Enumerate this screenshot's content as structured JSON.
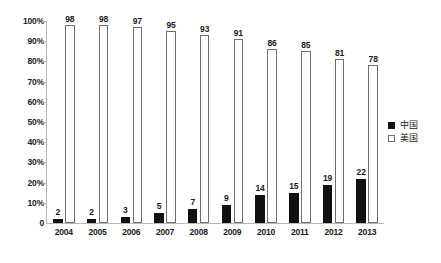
{
  "chart_data": {
    "type": "bar",
    "title": "",
    "subtitle": "",
    "xlabel": "",
    "ylabel": "",
    "categories": [
      "2004",
      "2005",
      "2006",
      "2007",
      "2008",
      "2009",
      "2010",
      "2011",
      "2012",
      "2013"
    ],
    "series": [
      {
        "name": "中国",
        "values": [
          2,
          2,
          3,
          5,
          7,
          9,
          14,
          15,
          19,
          22
        ],
        "color": "#111111",
        "style": "filled"
      },
      {
        "name": "美国",
        "values": [
          98,
          98,
          97,
          95,
          93,
          91,
          86,
          85,
          81,
          78
        ],
        "color": "#ffffff",
        "style": "outlined"
      }
    ],
    "ylim": [
      0,
      100
    ],
    "ytick_labels": [
      "100%",
      "90%",
      "80%",
      "70%",
      "60%",
      "50%",
      "40%",
      "30%",
      "20%",
      "10%",
      "0"
    ],
    "ytick_values": [
      100,
      90,
      80,
      70,
      60,
      50,
      40,
      30,
      20,
      10,
      0
    ],
    "grid": false,
    "data_labels": true,
    "legend_position": "right"
  },
  "legend": {
    "items": [
      {
        "label": "中国",
        "swatch": "filled-square-icon"
      },
      {
        "label": "美国",
        "swatch": "empty-square-icon"
      }
    ]
  }
}
